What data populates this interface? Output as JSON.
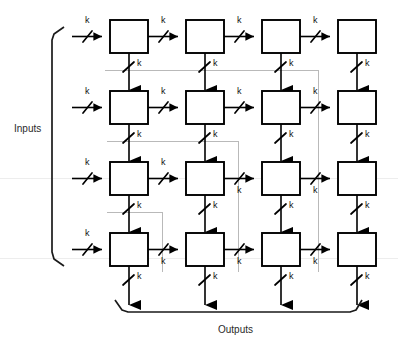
{
  "diagram": {
    "type": "block-diagram",
    "grid": {
      "rows": 4,
      "cols": 4
    },
    "labels": {
      "inputs": "Inputs",
      "outputs": "Outputs",
      "bus_width": "k"
    },
    "colors": {
      "stroke": "#000000",
      "box_fill": "#ffffff",
      "artifact_gray": "#b9b9b9",
      "background": "#ffffff",
      "text": "#1a1a1a"
    },
    "geometry": {
      "box_w": 38,
      "box_h": 33,
      "col_x": [
        110,
        186,
        262,
        338
      ],
      "row_y": [
        20,
        91,
        162,
        233
      ]
    },
    "bus_labels": {
      "horizontal": [
        {
          "row": 0,
          "values": [
            "k",
            "k",
            "k",
            "k"
          ]
        },
        {
          "row": 1,
          "values": [
            "k",
            "k",
            "k",
            "k"
          ]
        },
        {
          "row": 2,
          "values": [
            "k",
            "k",
            "k",
            "k"
          ]
        },
        {
          "row": 3,
          "values": [
            "k",
            "k",
            "k",
            "k"
          ]
        }
      ],
      "vertical": [
        {
          "col": 0,
          "values": [
            "k",
            "k",
            "k",
            "k"
          ]
        },
        {
          "col": 1,
          "values": [
            "k",
            "k",
            "k",
            "k"
          ]
        },
        {
          "col": 2,
          "values": [
            "k",
            "k",
            "k",
            "k"
          ]
        },
        {
          "col": 3,
          "values": [
            "k",
            "k",
            "k",
            "k"
          ]
        }
      ]
    },
    "braces": {
      "inputs": {
        "orientation": "vertical",
        "x": 52,
        "y1": 27,
        "y2": 266
      },
      "outputs": {
        "orientation": "horizontal",
        "y": 311,
        "x1": 115,
        "x2": 362
      }
    },
    "artifacts": {
      "horizontal_lines": [
        {
          "y": 70,
          "x1": 105,
          "x2": 318
        },
        {
          "y": 141,
          "x1": 107,
          "x2": 238
        },
        {
          "y": 212,
          "x1": 107,
          "x2": 162
        },
        {
          "y": 178,
          "x1": 0,
          "x2": 398
        },
        {
          "y": 258,
          "x1": 0,
          "x2": 398
        }
      ],
      "vertical_lines": [
        {
          "x": 318,
          "y1": 70,
          "y2": 272
        },
        {
          "x": 238,
          "y1": 141,
          "y2": 272
        },
        {
          "x": 162,
          "y1": 212,
          "y2": 272
        }
      ]
    }
  }
}
